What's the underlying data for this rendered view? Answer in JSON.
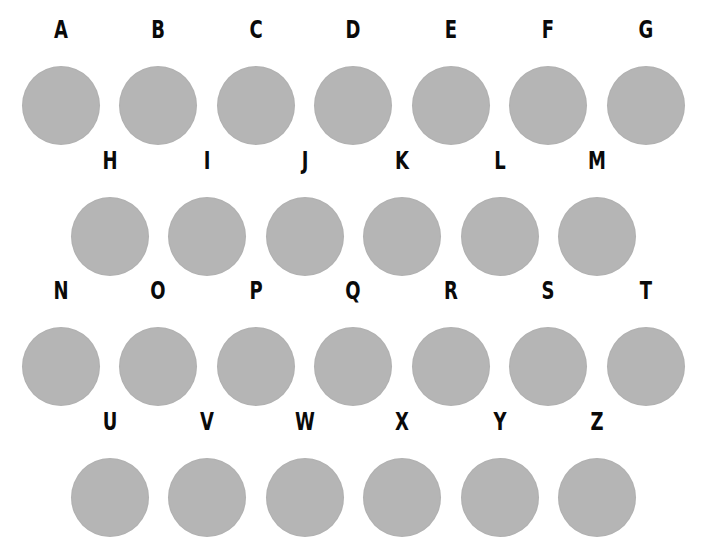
{
  "colors": {
    "circle": "#b5b5b5",
    "letter": "#0a0a0a",
    "background": "#ffffff"
  },
  "rows": [
    [
      "A",
      "B",
      "C",
      "D",
      "E",
      "F",
      "G"
    ],
    [
      "H",
      "I",
      "J",
      "K",
      "L",
      "M"
    ],
    [
      "N",
      "O",
      "P",
      "Q",
      "R",
      "S",
      "T"
    ],
    [
      "U",
      "V",
      "W",
      "X",
      "Y",
      "Z"
    ]
  ]
}
